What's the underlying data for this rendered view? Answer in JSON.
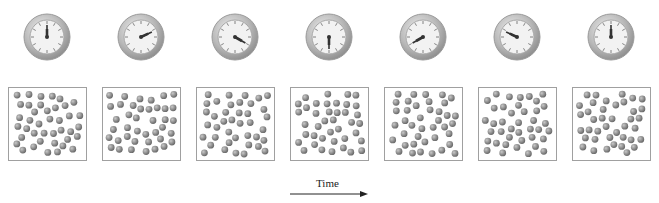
{
  "figure": {
    "time_label": "Time",
    "panels": [
      {
        "index": 1,
        "clock_minute_angle": 0,
        "clock_hour_angle": 0,
        "clock_icon": "clock-icon"
      },
      {
        "index": 2,
        "clock_minute_angle": 65,
        "clock_hour_angle": 65,
        "clock_icon": "clock-icon"
      },
      {
        "index": 3,
        "clock_minute_angle": 120,
        "clock_hour_angle": 120,
        "clock_icon": "clock-icon"
      },
      {
        "index": 4,
        "clock_minute_angle": 180,
        "clock_hour_angle": 180,
        "clock_icon": "clock-icon"
      },
      {
        "index": 5,
        "clock_minute_angle": 240,
        "clock_hour_angle": 240,
        "clock_icon": "clock-icon"
      },
      {
        "index": 6,
        "clock_minute_angle": 295,
        "clock_hour_angle": 295,
        "clock_icon": "clock-icon"
      },
      {
        "index": 7,
        "clock_minute_angle": 0,
        "clock_hour_angle": 0,
        "clock_icon": "clock-icon"
      }
    ],
    "particle_color": "#808080",
    "box_border_color": "#a0a0a0",
    "clock_ring_color": "#b8b8b8",
    "clock_face_color": "#f2f2f2",
    "hand_color": "#333333"
  }
}
